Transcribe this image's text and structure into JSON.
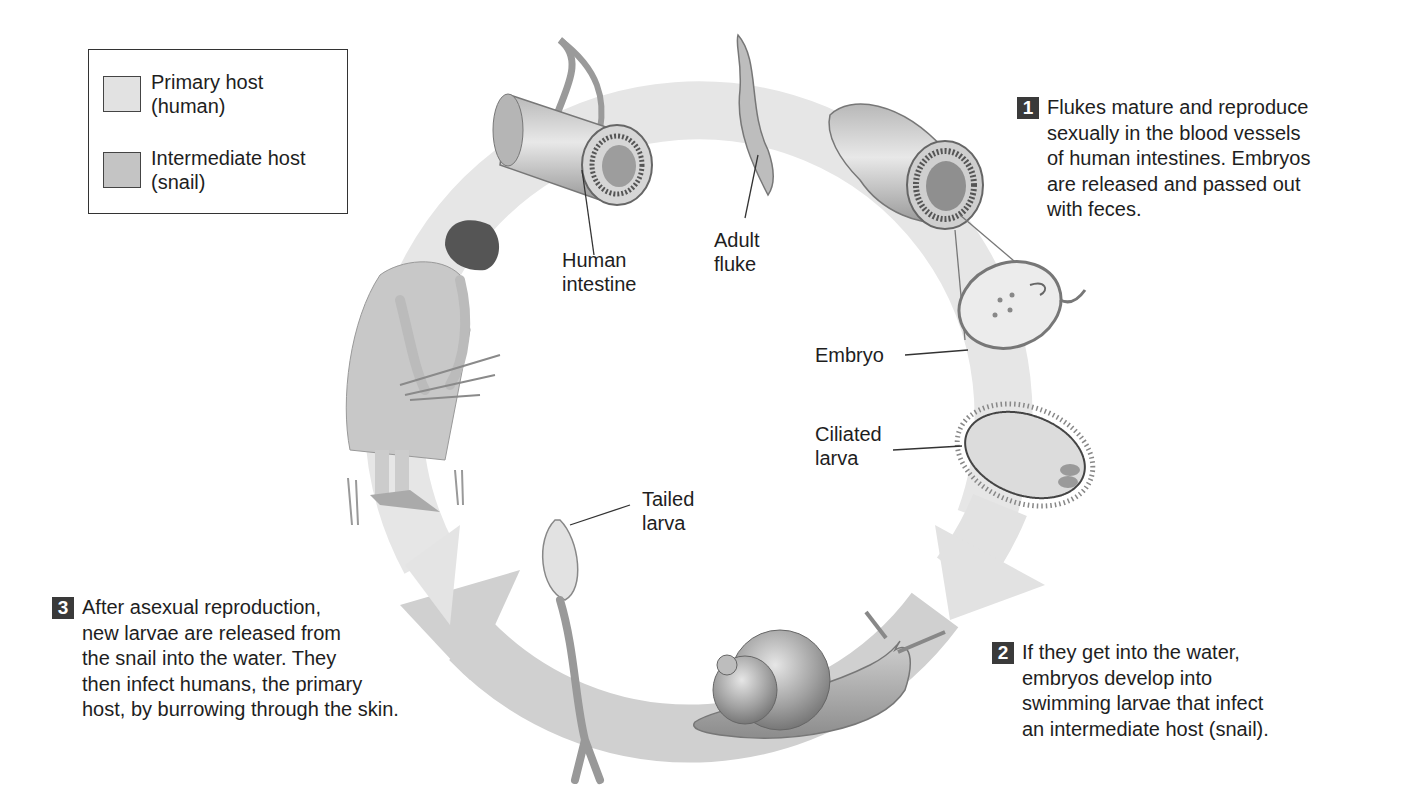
{
  "legend": {
    "items": [
      {
        "label": "Primary host\n(human)",
        "color": "#e2e2e2"
      },
      {
        "label": "Intermediate host\n(snail)",
        "color": "#c4c4c4"
      }
    ]
  },
  "steps": [
    {
      "number": "1",
      "text": "Flukes mature and reproduce\nsexually in the blood vessels\nof human intestines. Embryos\nare released and passed out\nwith feces."
    },
    {
      "number": "2",
      "text": "If they get into the water,\nembryos develop into\nswimming larvae that infect\nan intermediate host (snail)."
    },
    {
      "number": "3",
      "text": "After asexual reproduction,\nnew larvae are released from\nthe snail into the water. They\nthen infect humans, the primary\nhost, by burrowing through the skin."
    }
  ],
  "labels": {
    "human_intestine": "Human\nintestine",
    "adult_fluke": "Adult\nfluke",
    "embryo": "Embryo",
    "ciliated_larva": "Ciliated\nlarva",
    "tailed_larva": "Tailed\nlarva"
  },
  "colors": {
    "primary_host_band": "#e4e4e4",
    "intermediate_host_band": "#cfcfcf",
    "badge": "#3a3a3a",
    "text": "#1e1e1e"
  }
}
